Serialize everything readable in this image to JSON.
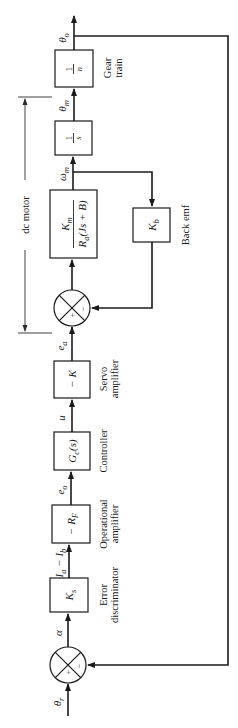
{
  "diagram": {
    "orientation": "rotated-ccw-90",
    "signals": {
      "input": "θ",
      "input_sub": "r",
      "error_angle": "α",
      "current_main": "I",
      "current_main_sub": "a",
      "current_minus": " − I",
      "current_minus_sub": "b",
      "opamp_out": "e",
      "opamp_out_sub": "o",
      "control": "u",
      "armature_voltage": "e",
      "armature_voltage_sub": "a",
      "motor_speed": "ω",
      "motor_speed_sub": "m",
      "motor_angle": "θ",
      "motor_angle_sub": "m",
      "output": "θ",
      "output_sub": "o"
    },
    "blocks": [
      {
        "id": "error-discriminator",
        "tf": "K",
        "tf_sub": "s",
        "label_line1": "Error",
        "label_line2": "discriminator"
      },
      {
        "id": "operational-amplifier",
        "tf": "− R",
        "tf_sub": "F",
        "label_line1": "Operational",
        "label_line2": "amplifier"
      },
      {
        "id": "controller",
        "tf": "G",
        "tf_sub": "c",
        "tf_tail": "(s)",
        "label_line1": "Controller",
        "label_line2": ""
      },
      {
        "id": "servo-amplifier",
        "tf": "− K",
        "label_line1": "Servo",
        "label_line2": "amplifier"
      },
      {
        "id": "dc-motor-dynamics",
        "num": "K",
        "num_sub": "m",
        "den": "R",
        "den_sub": "a",
        "den_tail": "(Js + B)"
      },
      {
        "id": "back-emf",
        "tf": "K",
        "tf_sub": "b",
        "label_line1": "Back emf"
      },
      {
        "id": "integrator",
        "num": "1",
        "den": "s"
      },
      {
        "id": "gear-train",
        "num": "1",
        "den": "n",
        "label_line1": "Gear",
        "label_line2": "train"
      }
    ],
    "summing_junctions": [
      {
        "id": "input-sum",
        "plus": "+",
        "minus": "−"
      },
      {
        "id": "motor-sum",
        "plus": "+",
        "minus": "−"
      }
    ],
    "bracket_label": "dc motor"
  }
}
